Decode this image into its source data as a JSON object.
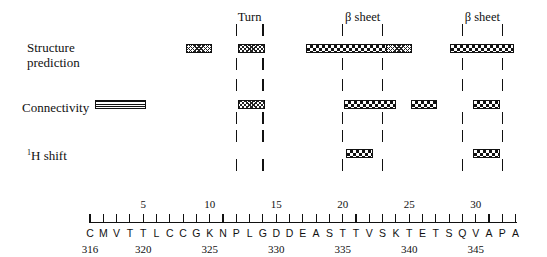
{
  "rows": [
    {
      "key": "structure",
      "label_lines": [
        "Structure",
        "prediction"
      ],
      "y": 48
    },
    {
      "key": "connectivity",
      "label_lines": [
        "Connectivity"
      ],
      "y": 104
    },
    {
      "key": "hshift",
      "label_sup": "1",
      "label_main": "H shift",
      "y": 153
    }
  ],
  "regions": [
    {
      "label": "Turn",
      "start": 12,
      "end": 14
    },
    {
      "label": "β sheet",
      "start": 20,
      "end": 23
    },
    {
      "label": "β sheet",
      "start": 29,
      "end": 32
    }
  ],
  "sequence": {
    "residues": [
      "C",
      "M",
      "V",
      "T",
      "T",
      "L",
      "C",
      "C",
      "G",
      "K",
      "N",
      "P",
      "L",
      "G",
      "D",
      "D",
      "E",
      "A",
      "S",
      "T",
      "T",
      "V",
      "S",
      "K",
      "T",
      "E",
      "T",
      "S",
      "Q",
      "V",
      "A",
      "P",
      "A"
    ],
    "top_ticks": [
      {
        "pos": 5,
        "label": "5"
      },
      {
        "pos": 10,
        "label": "10"
      },
      {
        "pos": 15,
        "label": "15"
      },
      {
        "pos": 20,
        "label": "20"
      },
      {
        "pos": 25,
        "label": "25"
      },
      {
        "pos": 30,
        "label": "30"
      }
    ],
    "bottom_numbers": [
      {
        "pos": 1,
        "label": "316"
      },
      {
        "pos": 5,
        "label": "320"
      },
      {
        "pos": 10,
        "label": "325"
      },
      {
        "pos": 15,
        "label": "330"
      },
      {
        "pos": 20,
        "label": "335"
      },
      {
        "pos": 25,
        "label": "340"
      },
      {
        "pos": 30,
        "label": "345"
      }
    ]
  },
  "bars": [
    {
      "row": "structure",
      "x": 186,
      "w": 26,
      "pattern": "xhatch"
    },
    {
      "row": "structure",
      "x": 238,
      "w": 27,
      "pattern": "xhatch"
    },
    {
      "row": "structure",
      "x": 306,
      "w": 81,
      "pattern": "checker"
    },
    {
      "row": "structure",
      "x": 386,
      "w": 26,
      "pattern": "xhatch"
    },
    {
      "row": "structure",
      "x": 450,
      "w": 64,
      "pattern": "checker"
    },
    {
      "row": "connectivity",
      "x": 95,
      "w": 51,
      "pattern": "stripe"
    },
    {
      "row": "connectivity",
      "x": 238,
      "w": 27,
      "pattern": "xhatch"
    },
    {
      "row": "connectivity",
      "x": 344,
      "w": 52,
      "pattern": "checker"
    },
    {
      "row": "connectivity",
      "x": 411,
      "w": 26,
      "pattern": "checker"
    },
    {
      "row": "connectivity",
      "x": 473,
      "w": 27,
      "pattern": "checker"
    },
    {
      "row": "hshift",
      "x": 346,
      "w": 27,
      "pattern": "checker"
    },
    {
      "row": "hshift",
      "x": 473,
      "w": 27,
      "pattern": "checker"
    }
  ]
}
